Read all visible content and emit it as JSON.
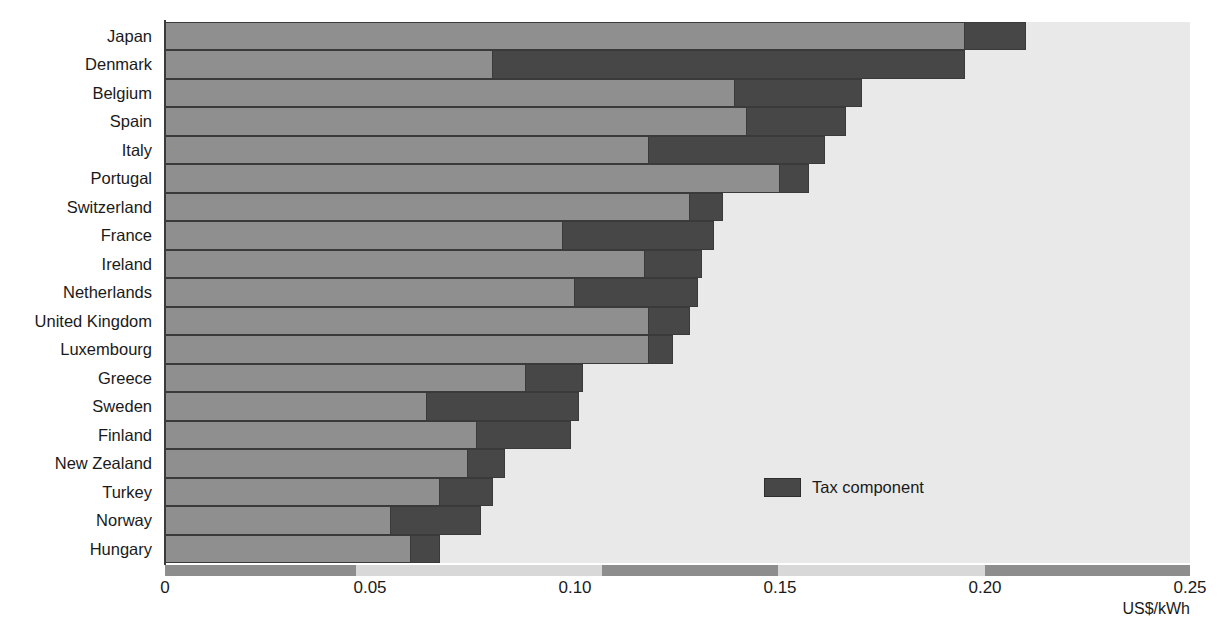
{
  "chart_data": {
    "type": "bar",
    "orientation": "horizontal",
    "stacked": true,
    "title": "",
    "xlabel": "US$/kWh",
    "ylabel": "",
    "xlim": [
      0,
      0.25
    ],
    "xticks": [
      0,
      0.05,
      0.1,
      0.15,
      0.2,
      0.25
    ],
    "xtick_labels": [
      "0",
      "0.05",
      "0.10",
      "0.15",
      "0.20",
      "0.25"
    ],
    "grid": false,
    "legend_position": "inside-center-right",
    "legend": [
      "Tax component"
    ],
    "categories": [
      "Japan",
      "Denmark",
      "Belgium",
      "Spain",
      "Italy",
      "Portugal",
      "Switzerland",
      "France",
      "Ireland",
      "Netherlands",
      "United Kingdom",
      "Luxembourg",
      "Greece",
      "Sweden",
      "Finland",
      "New Zealand",
      "Turkey",
      "Norway",
      "Hungary"
    ],
    "series": [
      {
        "name": "Price excluding tax",
        "color": "#8f8f8f",
        "values": [
          0.195,
          0.08,
          0.139,
          0.142,
          0.118,
          0.15,
          0.128,
          0.097,
          0.117,
          0.1,
          0.118,
          0.118,
          0.088,
          0.064,
          0.076,
          0.074,
          0.067,
          0.055,
          0.06
        ]
      },
      {
        "name": "Tax component",
        "color": "#474747",
        "values": [
          0.015,
          0.115,
          0.031,
          0.024,
          0.043,
          0.007,
          0.008,
          0.037,
          0.014,
          0.03,
          0.01,
          0.006,
          0.014,
          0.037,
          0.023,
          0.009,
          0.013,
          0.022,
          0.007
        ]
      }
    ],
    "totals": [
      0.21,
      0.195,
      0.17,
      0.166,
      0.161,
      0.157,
      0.136,
      0.134,
      0.131,
      0.13,
      0.128,
      0.124,
      0.102,
      0.101,
      0.099,
      0.083,
      0.08,
      0.077,
      0.067
    ]
  },
  "legend": {
    "label": "Tax component"
  },
  "axis": {
    "unit_label": "US$/kWh"
  },
  "colors": {
    "base_bar": "#8f8f8f",
    "tax_bar": "#474747",
    "plot_background": "#e9e9e9",
    "page_background": "#ffffff",
    "outline": "#3a3a3a"
  }
}
